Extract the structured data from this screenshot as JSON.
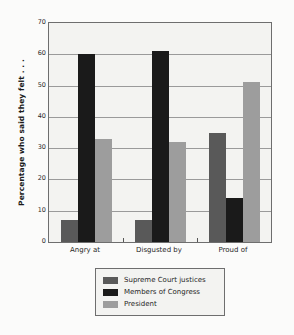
{
  "chart_data": {
    "type": "bar",
    "title": "",
    "xlabel": "",
    "ylabel": "Percentage who said they felt . . .",
    "categories": [
      "Angry at",
      "Disgusted by",
      "Proud of"
    ],
    "series": [
      {
        "name": "Supreme Court justices",
        "color": "#595959",
        "values": [
          7,
          7,
          35
        ]
      },
      {
        "name": "Members of Congress",
        "color": "#1a1a1a",
        "values": [
          60,
          61,
          14
        ]
      },
      {
        "name": "President",
        "color": "#9d9d9d",
        "values": [
          33,
          32,
          51
        ]
      }
    ],
    "ylim": [
      0,
      70
    ],
    "yticks": [
      0,
      10,
      20,
      30,
      40,
      50,
      60,
      70
    ],
    "ytick_labels": [
      "0",
      "10",
      "20",
      "30",
      "40",
      "50",
      "60",
      "70"
    ],
    "grid": true,
    "grid_axis": "y",
    "legend_position": "below-center",
    "plot_background": "#f3f3f1",
    "figure_background": "#fbfbfa",
    "axis_color": "#6e6e6e"
  }
}
